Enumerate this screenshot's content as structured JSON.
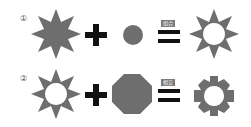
{
  "rows": [
    {
      "marker": "①",
      "operand_a": "nine-point-star",
      "operator": "+",
      "operand_b": "circle",
      "equals_label": "组合",
      "result": "sun-ring"
    },
    {
      "marker": "②",
      "operand_a": "sun-ring",
      "operator": "+",
      "operand_b": "octagon",
      "equals_label": "相交",
      "result": "gear-ring"
    }
  ],
  "colors": {
    "shape": "#6e6e6e",
    "operator": "#111111"
  }
}
